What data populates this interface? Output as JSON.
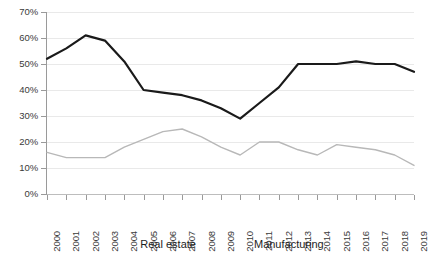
{
  "chart_data": {
    "type": "line",
    "title": "",
    "xlabel": "",
    "ylabel": "",
    "ylim": [
      0,
      70
    ],
    "ytick_step": 10,
    "ytick_labels": [
      "0%",
      "10%",
      "20%",
      "30%",
      "40%",
      "50%",
      "60%",
      "70%"
    ],
    "ytick_values": [
      0,
      10,
      20,
      30,
      40,
      50,
      60,
      70
    ],
    "grid": true,
    "grid_axis": "y",
    "legend_position": "bottom",
    "categories": [
      "2000",
      "2001",
      "2002",
      "2003",
      "2004",
      "2005",
      "2006",
      "2007",
      "2008",
      "2009",
      "2010",
      "2011",
      "2012",
      "2013",
      "2014",
      "2015",
      "2016",
      "2017",
      "2018",
      "2019"
    ],
    "x": [
      2000,
      2001,
      2002,
      2003,
      2004,
      2005,
      2006,
      2007,
      2008,
      2009,
      2010,
      2011,
      2012,
      2013,
      2014,
      2015,
      2016,
      2017,
      2018,
      2019
    ],
    "series": [
      {
        "name": "Real estate",
        "color": "#1a1a1a",
        "width": 2.2,
        "values": [
          52,
          56,
          61,
          59,
          51,
          40,
          39,
          38,
          36,
          33,
          29,
          35,
          41,
          50,
          50,
          50,
          51,
          50,
          50,
          47
        ]
      },
      {
        "name": "Manufacturing",
        "color": "#b8b8b8",
        "width": 1.4,
        "values": [
          16,
          14,
          14,
          14,
          18,
          21,
          24,
          25,
          22,
          18,
          15,
          20,
          20,
          17,
          15,
          19,
          18,
          17,
          15,
          11
        ]
      }
    ]
  },
  "legend": {
    "entries": [
      {
        "label": "Real estate"
      },
      {
        "label": "Manufacturing"
      }
    ]
  }
}
